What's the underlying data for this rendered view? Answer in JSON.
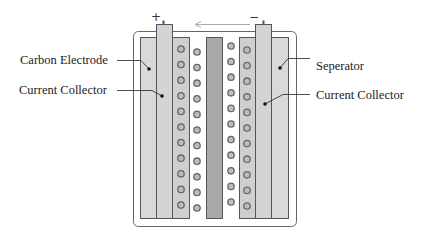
{
  "diagram": {
    "type": "supercapacitor-cross-section",
    "labels": {
      "left_top": "Carbon Electrode",
      "left_bottom": "Current Collector",
      "right_top": "Seperator",
      "right_bottom": "Current Collector"
    },
    "terminals": {
      "positive": "+",
      "negative": "−"
    },
    "arrow_direction": "left",
    "circles_per_column": 11,
    "colors": {
      "outline": "#555555",
      "electrode_fill": "#d9d9d9",
      "collector_fill": "#d4d4d4",
      "separator_fill": "#a8a8a8",
      "porous_fill": "#cfcfcf",
      "ion_stroke": "#666666",
      "ion_fill": "#bdbdbd",
      "arrow": "#aaaaaa",
      "casing_fill": "#ffffff"
    }
  }
}
